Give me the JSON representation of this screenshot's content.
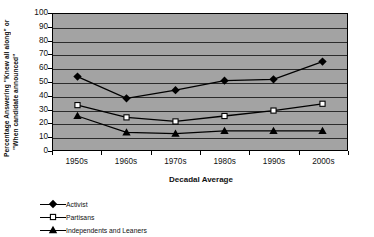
{
  "chart_data": {
    "type": "line",
    "title": "",
    "xlabel": "Decadal Average",
    "ylabel": "Percentage Answering \"Knew all along\" or \"When candidate announced\"",
    "ylabel_line1": "Percentage Answering \"Knew all along\" or",
    "ylabel_line2": "\"When candidate announced\"",
    "categories": [
      "1950s",
      "1960s",
      "1970s",
      "1980s",
      "1990s",
      "2000s"
    ],
    "ylim": [
      0,
      100
    ],
    "ytick_values": [
      0,
      10,
      20,
      30,
      40,
      50,
      60,
      70,
      80,
      90,
      100
    ],
    "ytick_labels": [
      "0",
      "10",
      "20",
      "30",
      "40",
      "50",
      "60",
      "70",
      "80",
      "90",
      "100"
    ],
    "grid": true,
    "legend_position": "below-left",
    "series": [
      {
        "name": "Activist",
        "marker": "diamond",
        "color": "#000000",
        "values": [
          54,
          38,
          44,
          51,
          52,
          65
        ]
      },
      {
        "name": "Partisans",
        "marker": "square-open",
        "color": "#000000",
        "values": [
          33,
          24,
          21,
          25,
          29,
          34
        ]
      },
      {
        "name": "Independents and Leaners",
        "marker": "triangle",
        "color": "#000000",
        "values": [
          25,
          13,
          12,
          14,
          14,
          14
        ]
      }
    ]
  },
  "legend": {
    "items": [
      {
        "label": "Activist"
      },
      {
        "label": "Partisans"
      },
      {
        "label": "Independents and Leaners"
      }
    ]
  },
  "colors": {
    "plot_background": "#a3a3a3",
    "page_background": "#ffffff",
    "gridline": "#2b2b2b",
    "series": "#000000"
  }
}
